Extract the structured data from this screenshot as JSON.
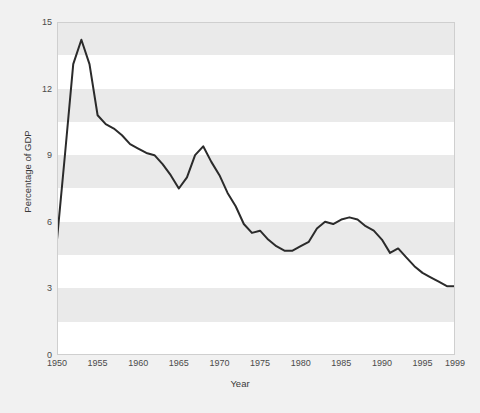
{
  "chart_data": {
    "type": "line",
    "title": "",
    "xlabel": "Year",
    "ylabel": "Percentage of GDP",
    "xlim": [
      1950,
      1999
    ],
    "ylim": [
      0,
      15
    ],
    "xticks": [
      1950,
      1955,
      1960,
      1965,
      1970,
      1975,
      1980,
      1985,
      1990,
      1995,
      1999
    ],
    "xtick_labels": [
      "1950",
      "1955",
      "1960",
      "1965",
      "1970",
      "1975",
      "1980",
      "1985",
      "1990",
      "1995",
      "1999"
    ],
    "yticks": [
      0,
      3,
      6,
      9,
      12,
      15
    ],
    "ytick_labels": [
      "0",
      "3",
      "6",
      "9",
      "12",
      "15"
    ],
    "grid": false,
    "banded_background": true,
    "band_interval": 1.5,
    "legend": null,
    "line_color": "#2b2b2b",
    "line_width": 2.0,
    "x": [
      1950,
      1951,
      1952,
      1953,
      1954,
      1955,
      1956,
      1957,
      1958,
      1959,
      1960,
      1961,
      1962,
      1963,
      1964,
      1965,
      1966,
      1967,
      1968,
      1969,
      1970,
      1971,
      1972,
      1973,
      1974,
      1975,
      1976,
      1977,
      1978,
      1979,
      1980,
      1981,
      1982,
      1983,
      1984,
      1985,
      1986,
      1987,
      1988,
      1989,
      1990,
      1991,
      1992,
      1993,
      1994,
      1995,
      1996,
      1997,
      1998,
      1999
    ],
    "values": [
      5.2,
      9.1,
      13.1,
      14.2,
      13.1,
      10.8,
      10.4,
      10.2,
      9.9,
      9.5,
      9.3,
      9.1,
      9.0,
      8.6,
      8.1,
      7.5,
      8.0,
      9.0,
      9.4,
      8.7,
      8.1,
      7.3,
      6.7,
      5.9,
      5.5,
      5.6,
      5.2,
      4.9,
      4.7,
      4.7,
      4.9,
      5.1,
      5.7,
      6.0,
      5.9,
      6.1,
      6.2,
      6.1,
      5.8,
      5.6,
      5.2,
      4.6,
      4.8,
      4.4,
      4.0,
      3.7,
      3.5,
      3.3,
      3.1,
      3.1
    ],
    "series_name": "Defense spending"
  },
  "axes": {
    "ylabel_text": "Percentage of GDP",
    "xlabel_text": "Year"
  },
  "top_text": ""
}
